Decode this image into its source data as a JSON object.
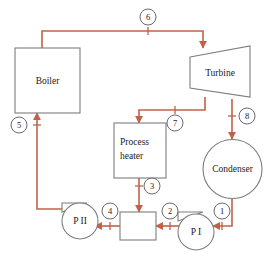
{
  "diagram": {
    "colors": {
      "pipe": "#c26149",
      "outline": "#7d7d7d",
      "label_circle": "#5a5a5a",
      "text": "#1a1a1a",
      "background": "#ffffff"
    },
    "components": [
      {
        "id": "boiler",
        "label": "Boiler",
        "shape": "rectangle"
      },
      {
        "id": "turbine",
        "label": "Turbine",
        "shape": "trapezoid"
      },
      {
        "id": "process-heater",
        "label_line1": "Process",
        "label_line2": "heater",
        "shape": "rectangle"
      },
      {
        "id": "condenser",
        "label": "Condenser",
        "shape": "circle"
      },
      {
        "id": "mixing-chamber",
        "label": "",
        "shape": "rectangle"
      },
      {
        "id": "pump-2",
        "label": "P II",
        "shape": "pump"
      },
      {
        "id": "pump-1",
        "label": "P I",
        "shape": "pump"
      }
    ],
    "state_points": [
      {
        "id": "1",
        "label": "1"
      },
      {
        "id": "2",
        "label": "2"
      },
      {
        "id": "3",
        "label": "3"
      },
      {
        "id": "4",
        "label": "4"
      },
      {
        "id": "5",
        "label": "5"
      },
      {
        "id": "6",
        "label": "6"
      },
      {
        "id": "7",
        "label": "7"
      },
      {
        "id": "8",
        "label": "8"
      }
    ]
  }
}
